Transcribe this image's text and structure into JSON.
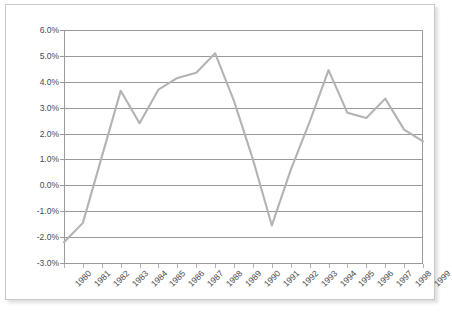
{
  "chart_data": {
    "type": "line",
    "title": "",
    "subtitle": "",
    "xlabel": "",
    "ylabel": "",
    "categories": [
      "1980",
      "1981",
      "1982",
      "1983",
      "1984",
      "1985",
      "1986",
      "1987",
      "1988",
      "1989",
      "1990",
      "1991",
      "1992",
      "1993",
      "1994",
      "1995",
      "1996",
      "1997",
      "1998",
      "1999"
    ],
    "values": [
      -2.2,
      -1.45,
      1.1,
      3.65,
      2.4,
      3.7,
      4.15,
      4.35,
      5.1,
      3.25,
      1.0,
      -1.55,
      0.6,
      2.45,
      4.45,
      2.8,
      2.6,
      3.35,
      2.15,
      1.7
    ],
    "series": [
      {
        "name": "series-1",
        "color": "#b3b3b3",
        "values": [
          -2.2,
          -1.45,
          1.1,
          3.65,
          2.4,
          3.7,
          4.15,
          4.35,
          5.1,
          3.25,
          1.0,
          -1.55,
          0.6,
          2.45,
          4.45,
          2.8,
          2.6,
          3.35,
          2.15,
          1.7
        ]
      }
    ],
    "ylim": [
      -3.0,
      6.0
    ],
    "ytick_step": 1.0,
    "ytick_labels": [
      "6.0%",
      "5.0%",
      "4.0%",
      "3.0%",
      "2.0%",
      "1.0%",
      "0.0%",
      "-1.0%",
      "-2.0%",
      "-3.0%"
    ],
    "ytick_values": [
      6.0,
      5.0,
      4.0,
      3.0,
      2.0,
      1.0,
      0.0,
      -1.0,
      -2.0,
      -3.0
    ],
    "grid": true,
    "grid_color": "#9a9a9a",
    "legend": false,
    "legend_position": "none",
    "annotations": [],
    "value_unit": "percent",
    "xtick_rotation": -45
  },
  "colors": {
    "line": "#b3b3b3",
    "grid": "#9a9a9a",
    "axis": "#9a9a9a",
    "text": "#4a4a4a",
    "frame_border": "#c8c8c8",
    "background": "#ffffff"
  }
}
